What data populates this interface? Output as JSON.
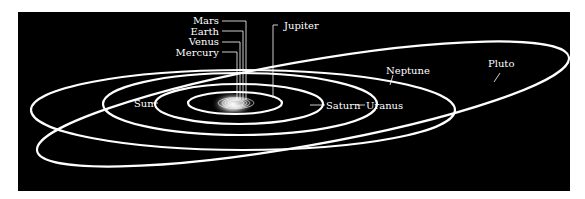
{
  "diagram": {
    "type": "solar-system-orbits",
    "background": "#000000",
    "orbit_color": "#ffffff",
    "labels": {
      "sun": "Sun",
      "mercury": "Mercury",
      "venus": "Venus",
      "earth": "Earth",
      "mars": "Mars",
      "jupiter": "Jupiter",
      "saturn": "Saturn",
      "uranus": "Uranus",
      "neptune": "Neptune",
      "pluto": "Pluto"
    }
  }
}
